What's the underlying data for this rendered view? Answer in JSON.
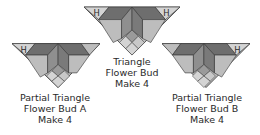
{
  "colors": {
    "dark": "#6e6e6e",
    "medium": "#8f8f8f",
    "light": "#bdbdbd",
    "pale": "#d4d4d4",
    "outline": "#3a3a3a",
    "text": "#2a2a2a"
  },
  "blocks": [
    {
      "id": "partial-a",
      "label_lines": [
        "Partial Triangle",
        "Flower Bud A",
        "Make 4"
      ],
      "h_marks": [
        "H"
      ]
    },
    {
      "id": "full",
      "label_lines": [
        "Triangle",
        "Flower Bud",
        "Make 4"
      ],
      "h_marks": [
        "H",
        "H"
      ]
    },
    {
      "id": "partial-b",
      "label_lines": [
        "Partial Triangle",
        "Flower Bud B",
        "Make 4"
      ],
      "h_marks": [
        "H"
      ]
    }
  ]
}
